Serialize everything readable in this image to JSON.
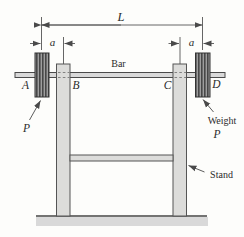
{
  "figure": {
    "name": "barbell-on-stand-mechanics-diagram",
    "labels": {
      "total_length": "L",
      "offset_left": "a",
      "offset_right": "a",
      "bar": "Bar",
      "point_a": "A",
      "point_b": "B",
      "point_c": "C",
      "point_d": "D",
      "load_left": "P",
      "load_right": "P",
      "weight": "Weight",
      "stand": "Stand"
    },
    "colors": {
      "background": "#fdfdfb",
      "line": "#4a4a4a",
      "dim_line": "#555555",
      "member_fill": "#dcdcda",
      "bar_fill": "#d9d9d9",
      "weight_stripe_dark": "#474747",
      "weight_stripe_light": "#9e9e9e",
      "weight_outline": "#333333",
      "ground_shadow": "#d9d9d9",
      "text": "#2b2b2b"
    }
  }
}
